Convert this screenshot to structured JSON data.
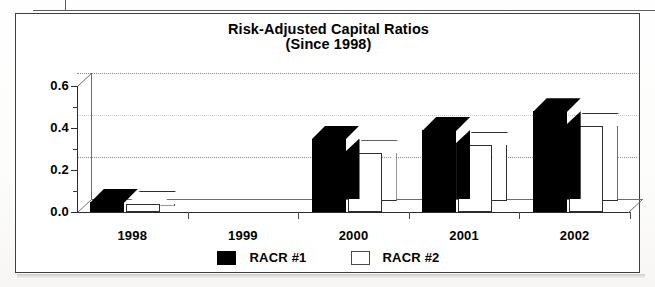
{
  "document": {
    "top_table_partial_row": ""
  },
  "chart": {
    "title_line1": "Risk-Adjusted Capital Ratios",
    "title_line2": "(Since 1998)",
    "colors": {
      "series1": "#000000",
      "series2": "#ffffff",
      "axis": "#2c2c2c",
      "gridline": "#8e8e8e",
      "background": "#ffffff"
    }
  },
  "chart_data": {
    "type": "bar",
    "title": "Risk-Adjusted Capital Ratios (Since 1998)",
    "xlabel": "",
    "ylabel": "",
    "ylim": [
      0.0,
      0.6
    ],
    "yticks": [
      "0.0",
      "0.2",
      "0.4",
      "0.6"
    ],
    "ytick_values": [
      0.0,
      0.2,
      0.4,
      0.6
    ],
    "minor_tick_interval": 0.1,
    "grid": true,
    "grid_style": "dotted horizontal on back wall",
    "three_d": true,
    "legend_position": "bottom-center",
    "categories": [
      "1998",
      "1999",
      "2000",
      "2001",
      "2002"
    ],
    "series": [
      {
        "name": "RACR #1",
        "color": "#000000",
        "values": [
          0.05,
          0.0,
          0.35,
          0.39,
          0.48
        ]
      },
      {
        "name": "RACR #2",
        "color": "#ffffff",
        "values": [
          0.04,
          0.0,
          0.28,
          0.32,
          0.41
        ]
      }
    ]
  },
  "legend": {
    "items": [
      {
        "label": "RACR #1",
        "swatch": "black"
      },
      {
        "label": "RACR #2",
        "swatch": "white"
      }
    ]
  }
}
